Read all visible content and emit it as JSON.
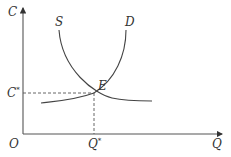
{
  "diagram": {
    "title": "",
    "axes": {
      "y_label": "C",
      "x_label": "Q",
      "origin_label": "O"
    },
    "curves": [
      {
        "name": "S",
        "label": "S"
      },
      {
        "name": "D",
        "label": "D"
      }
    ],
    "equilibrium": {
      "point_label": "E",
      "y_value_label": "C",
      "y_value_superscript": "*",
      "x_value_label": "Q",
      "x_value_superscript": "*"
    },
    "colors": {
      "line": "#444444",
      "text": "#333333"
    }
  }
}
